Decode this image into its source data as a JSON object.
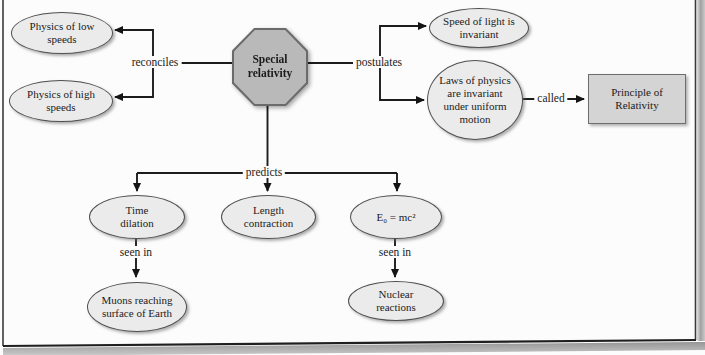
{
  "figure": {
    "type": "concept-map",
    "topic": "Special relativity"
  },
  "nodes": {
    "special_relativity": {
      "label": "Special relativity",
      "shape": "octagon"
    },
    "physics_low": {
      "label": "Physics of low speeds",
      "shape": "ellipse"
    },
    "physics_high": {
      "label": "Physics of high speeds",
      "shape": "ellipse"
    },
    "speed_of_light": {
      "label": "Speed of light is invariant",
      "shape": "ellipse"
    },
    "laws_of_physics": {
      "label": "Laws of physics are invariant under uniform motion",
      "shape": "ellipse"
    },
    "principle_of_relativity": {
      "label": "Principle of Relativity",
      "shape": "rectangle"
    },
    "time_dilation": {
      "label": "Time dilation",
      "shape": "ellipse"
    },
    "length_contraction": {
      "label": "Length contraction",
      "shape": "ellipse"
    },
    "mass_energy": {
      "label": "E₀ = mc²",
      "shape": "ellipse"
    },
    "muons": {
      "label": "Muons reaching surface of Earth",
      "shape": "ellipse"
    },
    "nuclear_reactions": {
      "label": "Nuclear reactions",
      "shape": "ellipse"
    }
  },
  "edge_labels": {
    "reconciles": "reconciles",
    "postulates": "postulates",
    "predicts": "predicts",
    "called": "called",
    "seen_in_left": "seen in",
    "seen_in_right": "seen in"
  },
  "colors": {
    "octagon_fill": "#b9b9b9",
    "octagon_border": "#6b6b6b",
    "ellipse_fill": "#ebebeb",
    "ellipse_border": "#4f4f4f",
    "rect_fill": "#d4d4d4",
    "rect_border": "#6e6e6e",
    "connector": "#1c1c1c",
    "text": "#1b1b1b",
    "page_background": "#fcfcfc"
  }
}
